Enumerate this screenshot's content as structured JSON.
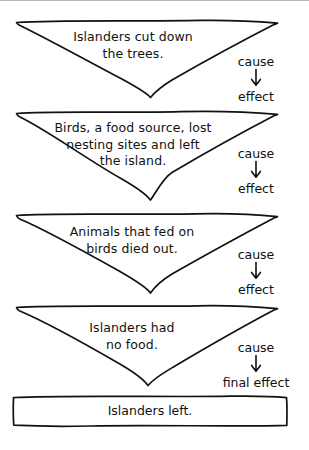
{
  "diagram": {
    "type": "cause-and-effect-chain",
    "title_visible": false,
    "colors": {
      "ink": "#111111",
      "background": "#ffffff",
      "rule": "#b8b8b8"
    },
    "nodes": [
      {
        "id": "node-1",
        "shape": "triangle-down",
        "text": "Islanders cut down\nthe trees."
      },
      {
        "id": "node-2",
        "shape": "triangle-down",
        "text": "Birds, a food source, lost\nnesting sites and left\nthe island."
      },
      {
        "id": "node-3",
        "shape": "triangle-down",
        "text": "Animals that fed on\nbirds died out."
      },
      {
        "id": "node-4",
        "shape": "triangle-down",
        "text": "Islanders had\nno food."
      },
      {
        "id": "node-5",
        "shape": "rectangle",
        "text": "Islanders left."
      }
    ],
    "connectors": [
      {
        "id": "connector-1",
        "cause_label": "cause",
        "effect_label": "effect",
        "arrow": "down-arrow-icon"
      },
      {
        "id": "connector-2",
        "cause_label": "cause",
        "effect_label": "effect",
        "arrow": "down-arrow-icon"
      },
      {
        "id": "connector-3",
        "cause_label": "cause",
        "effect_label": "effect",
        "arrow": "down-arrow-icon"
      },
      {
        "id": "connector-4",
        "cause_label": "cause",
        "effect_label": "final effect",
        "arrow": "down-arrow-icon"
      }
    ]
  }
}
